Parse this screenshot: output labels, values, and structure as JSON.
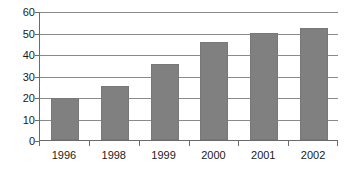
{
  "chart_data": {
    "type": "bar",
    "title": "",
    "subtitle": "",
    "xlabel": "",
    "ylabel": "",
    "categories": [
      "1996",
      "1998",
      "1999",
      "2000",
      "2001",
      "2002"
    ],
    "values": [
      19.5,
      25,
      35.5,
      45.5,
      50,
      52
    ],
    "series": [
      {
        "name": "Series 1",
        "values": [
          19.5,
          25,
          35.5,
          45.5,
          50,
          52
        ],
        "color": "#808080"
      }
    ],
    "ylim": [
      0,
      60
    ],
    "ytick_interval": 10,
    "ytick_labels": [
      "0",
      "10",
      "20",
      "30",
      "40",
      "50",
      "60"
    ],
    "ytick_values": [
      0,
      10,
      20,
      30,
      40,
      50,
      60
    ],
    "grid": true,
    "grid_orientation": "horizontal",
    "legend": false,
    "legend_position": "none",
    "annotations": [],
    "bar_color": "#808080",
    "gridline_color": "#8a8a8a",
    "axis_color": "#6b6b6b",
    "background_color": "#ffffff",
    "text_color": "#1a1a1a"
  }
}
